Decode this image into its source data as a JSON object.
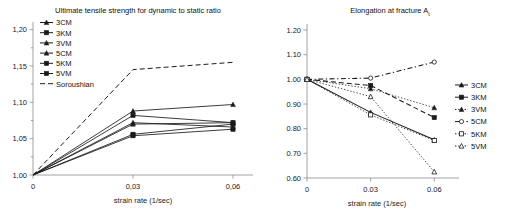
{
  "figure": {
    "panels": [
      "left",
      "right"
    ],
    "background": "#ffffff",
    "line_color": "#1a1a1a"
  },
  "left": {
    "title": "Ultimate tensile strength for dynamic to static ratio",
    "xlabel": "strain rate (1/sec)",
    "ylabel": "",
    "xticks": [
      "0",
      "0,03",
      "0,06"
    ],
    "yticks": [
      "1,00",
      "1,05",
      "1,10",
      "1,15",
      "1,20"
    ],
    "legend": [
      {
        "label": "3CM",
        "marker": "triangle-filled",
        "dash": "solid"
      },
      {
        "label": "3KM",
        "marker": "square-filled",
        "dash": "solid"
      },
      {
        "label": "3VM",
        "marker": "triangle-filled",
        "dash": "solid"
      },
      {
        "label": "5CM",
        "marker": "triangle-filled",
        "dash": "solid"
      },
      {
        "label": "5KM",
        "marker": "square-filled",
        "dash": "solid"
      },
      {
        "label": "5VM",
        "marker": "square-filled",
        "dash": "solid"
      },
      {
        "label": "Soroushian",
        "marker": "none",
        "dash": "dashed"
      }
    ]
  },
  "right": {
    "title_main": "Elongation at fracture A",
    "title_sub": "t",
    "xlabel": "strain rate (1/sec)",
    "ylabel": "",
    "xticks": [
      "0",
      "0.03",
      "0.06"
    ],
    "yticks": [
      "0.60",
      "0.70",
      "0.80",
      "0.90",
      "1.00",
      "1.10",
      "1.20"
    ],
    "legend": [
      {
        "label": "3CM",
        "marker": "triangle-filled",
        "dash": "solid"
      },
      {
        "label": "3KM",
        "marker": "square-filled",
        "dash": "solid"
      },
      {
        "label": "3VM",
        "marker": "triangle-filled",
        "dash": "dotted"
      },
      {
        "label": "5CM",
        "marker": "circle-open",
        "dash": "dashdot"
      },
      {
        "label": "5KM",
        "marker": "square-open",
        "dash": "dotted"
      },
      {
        "label": "5VM",
        "marker": "triangle-open",
        "dash": "dotted"
      }
    ]
  },
  "chart_data": [
    {
      "type": "line",
      "panel": "left",
      "title": "Ultimate tensile strength for dynamic to static ratio",
      "xlabel": "strain rate (1/sec)",
      "ylabel": "",
      "x": [
        0,
        0.03,
        0.06
      ],
      "xlim": [
        0,
        0.066
      ],
      "ylim": [
        1.0,
        1.205
      ],
      "grid": false,
      "legend_position": "upper-left-inside",
      "series": [
        {
          "name": "3CM",
          "values": [
            1.0,
            1.088,
            1.097
          ],
          "dash": "solid",
          "marker": "triangle-filled"
        },
        {
          "name": "3KM",
          "values": [
            1.0,
            1.082,
            1.072
          ],
          "dash": "solid",
          "marker": "square-filled"
        },
        {
          "name": "3VM",
          "values": [
            1.0,
            1.072,
            1.066
          ],
          "dash": "solid",
          "marker": "triangle-filled"
        },
        {
          "name": "5CM",
          "values": [
            1.0,
            1.07,
            1.072
          ],
          "dash": "solid",
          "marker": "triangle-filled"
        },
        {
          "name": "5KM",
          "values": [
            1.0,
            1.056,
            1.07
          ],
          "dash": "solid",
          "marker": "square-filled"
        },
        {
          "name": "5VM",
          "values": [
            1.0,
            1.054,
            1.063
          ],
          "dash": "solid",
          "marker": "square-filled"
        },
        {
          "name": "Soroushian",
          "values": [
            1.0,
            1.145,
            1.155
          ],
          "dash": "dashed",
          "marker": "none"
        }
      ]
    },
    {
      "type": "line",
      "panel": "right",
      "title": "Elongation at fracture At",
      "xlabel": "strain rate (1/sec)",
      "ylabel": "",
      "x": [
        0,
        0.03,
        0.06
      ],
      "xlim": [
        0,
        0.066
      ],
      "ylim": [
        0.6,
        1.2
      ],
      "grid": false,
      "legend_position": "right-outside",
      "series": [
        {
          "name": "3CM",
          "values": [
            1.0,
            0.866,
            0.755
          ],
          "dash": "solid",
          "marker": "triangle-filled"
        },
        {
          "name": "3KM",
          "values": [
            1.0,
            0.975,
            0.845
          ],
          "dash": "dashed",
          "marker": "square-filled"
        },
        {
          "name": "3VM",
          "values": [
            1.0,
            0.962,
            0.885
          ],
          "dash": "dotted",
          "marker": "triangle-filled"
        },
        {
          "name": "5CM",
          "values": [
            1.0,
            1.005,
            1.07
          ],
          "dash": "dashdot",
          "marker": "circle-open"
        },
        {
          "name": "5KM",
          "values": [
            1.0,
            0.856,
            0.752
          ],
          "dash": "dotted",
          "marker": "square-open"
        },
        {
          "name": "5VM",
          "values": [
            1.0,
            0.93,
            0.625
          ],
          "dash": "dotted",
          "marker": "triangle-open"
        }
      ]
    }
  ]
}
